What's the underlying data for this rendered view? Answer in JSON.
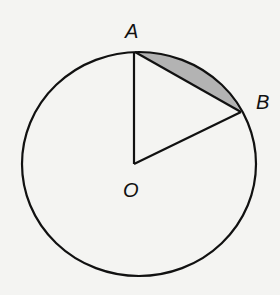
{
  "diagram": {
    "labels": {
      "A": "A",
      "B": "B",
      "O": "O"
    },
    "colors": {
      "stroke": "#111111",
      "shaded_segment": "#b3b3b3",
      "background": "#f4f4f2"
    }
  }
}
